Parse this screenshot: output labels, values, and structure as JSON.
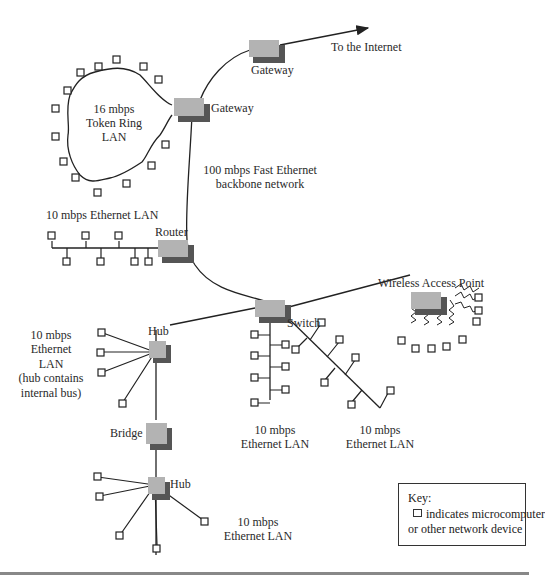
{
  "diagram": {
    "devices": {
      "gateway_top": "Gateway",
      "gateway_ring": "Gateway",
      "router": "Router",
      "switch": "Switch",
      "hub_top": "Hub",
      "bridge": "Bridge",
      "hub_bottom": "Hub",
      "wireless_ap": "Wireless Access Point"
    },
    "labels": {
      "internet": "To the Internet",
      "token_ring_1": "16 mbps",
      "token_ring_2": "Token Ring",
      "token_ring_3": "LAN",
      "backbone_1": "100 mbps Fast Ethernet",
      "backbone_2": "backbone network",
      "router_lan": "10 mbps Ethernet  LAN",
      "hub_lan_1": "10 mbps",
      "hub_lan_2": "Ethernet",
      "hub_lan_3": "LAN",
      "hub_lan_4": "(hub contains",
      "hub_lan_5": "internal bus)",
      "switch_vlan_1": "10 mbps",
      "switch_vlan_2": "Ethernet LAN",
      "switch_dlan_1": "10 mbps",
      "switch_dlan_2": "Ethernet LAN",
      "hub2_lan_1": "10 mbps",
      "hub2_lan_2": "Ethernet LAN"
    },
    "key": {
      "title": "Key:",
      "line1": "indicates microcomputer",
      "line2": "or other network device",
      "icon": "square-device-icon"
    },
    "colors": {
      "device_fill": "#b3b3b3",
      "device_shadow": "#555555",
      "line": "#222222"
    }
  }
}
